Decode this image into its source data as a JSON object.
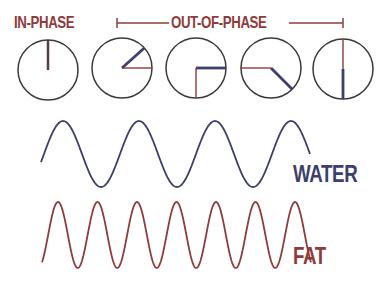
{
  "colors": {
    "fat": "#8f3b3b",
    "water": "#3d3f6e",
    "circle": "#3a3a3a",
    "background": "#ffffff"
  },
  "header": {
    "in_phase_label": "IN-PHASE",
    "out_of_phase_label": "OUT-OF-PHASE",
    "bracket": {
      "x1": 117,
      "x2": 343,
      "y": 23
    }
  },
  "clocks": [
    {
      "name": "in-phase",
      "cx": 48,
      "cy": 70,
      "r": 30,
      "fat_angle_deg": 90,
      "water_angle_deg": 90
    },
    {
      "name": "out-of-phase-1",
      "cx": 122,
      "cy": 68,
      "r": 30,
      "fat_angle_deg": 0,
      "water_angle_deg": 42
    },
    {
      "name": "out-of-phase-2",
      "cx": 196,
      "cy": 68,
      "r": 30,
      "fat_angle_deg": -90,
      "water_angle_deg": 0
    },
    {
      "name": "out-of-phase-3",
      "cx": 271,
      "cy": 68,
      "r": 30,
      "fat_angle_deg": 180,
      "water_angle_deg": -45
    },
    {
      "name": "out-of-phase-4",
      "cx": 343,
      "cy": 69,
      "r": 30,
      "fat_angle_deg": 90,
      "water_angle_deg": -90
    }
  ],
  "waves": {
    "water": {
      "label": "WATER",
      "x_start": 41,
      "x_end": 310,
      "center_y": 154,
      "amplitude": 33,
      "first_peak_x": 63,
      "period": 76
    },
    "fat": {
      "label": "FAT",
      "x_start": 42,
      "x_end": 311,
      "center_y": 235,
      "amplitude": 33,
      "first_peak_x": 58,
      "period": 39.5
    }
  }
}
